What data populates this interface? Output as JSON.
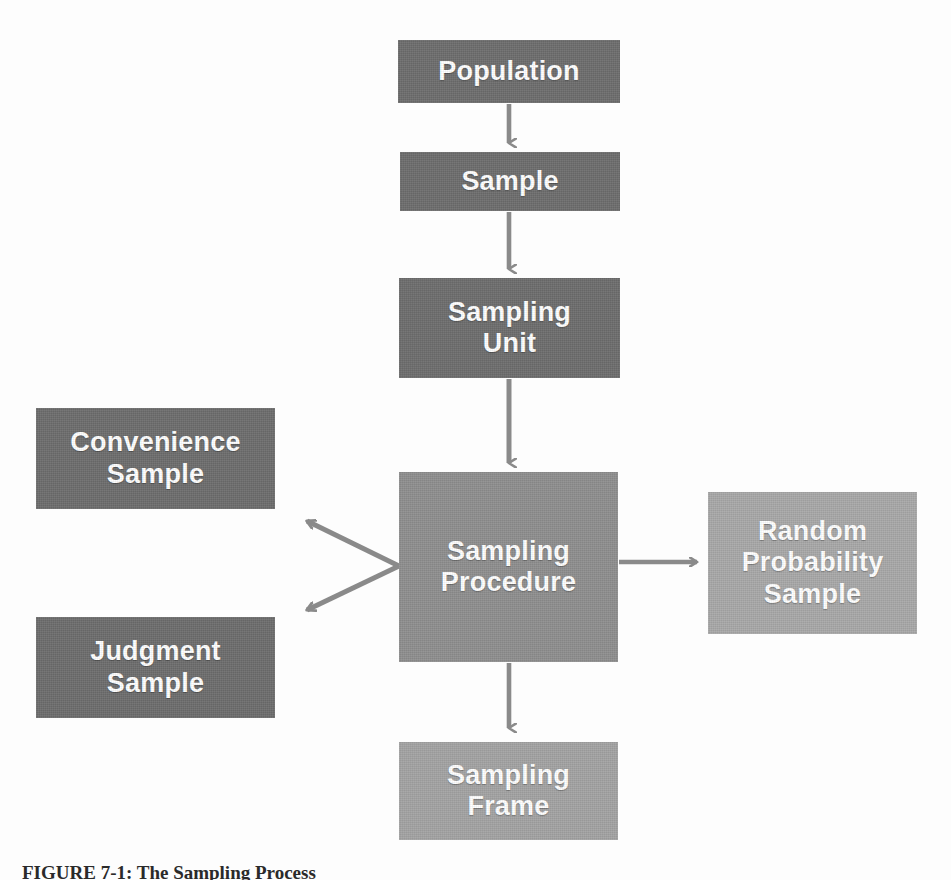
{
  "figure": {
    "caption": "FIGURE 7-1: The Sampling Process",
    "background_color": "#fdfdfd"
  },
  "colors": {
    "box_dark": "#6e6e6e",
    "box_mid": "#8f8f8f",
    "box_light": "#a9a9a9",
    "box_light_alt": "#a4a4a4",
    "arrow": "#8a8a8a",
    "text": "#ffffff",
    "caption_text": "#2a2a2a"
  },
  "nodes": {
    "population": {
      "label": "Population",
      "tone": "dark"
    },
    "sample": {
      "label": "Sample",
      "tone": "dark"
    },
    "sampling_unit": {
      "label": "Sampling\nUnit",
      "tone": "dark"
    },
    "sampling_procedure": {
      "label": "Sampling\nProcedure",
      "tone": "mid"
    },
    "convenience_sample": {
      "label": "Convenience\nSample",
      "tone": "dark"
    },
    "judgment_sample": {
      "label": "Judgment\nSample",
      "tone": "dark"
    },
    "random_probability_sample": {
      "label": "Random\nProbability\nSample",
      "tone": "light"
    },
    "sampling_frame": {
      "label": "Sampling\nFrame",
      "tone": "light_alt"
    }
  },
  "edges": [
    {
      "id": "population-to-sample",
      "from": "population",
      "to": "sample",
      "direction": "down"
    },
    {
      "id": "sample-to-sampling-unit",
      "from": "sample",
      "to": "sampling_unit",
      "direction": "down"
    },
    {
      "id": "sampling-unit-to-sampling-procedure",
      "from": "sampling_unit",
      "to": "sampling_procedure",
      "direction": "down"
    },
    {
      "id": "sampling-procedure-to-convenience-sample",
      "from": "sampling_procedure",
      "to": "convenience_sample",
      "direction": "up-left"
    },
    {
      "id": "sampling-procedure-to-judgment-sample",
      "from": "sampling_procedure",
      "to": "judgment_sample",
      "direction": "down-left"
    },
    {
      "id": "sampling-procedure-to-random-probability-sample",
      "from": "sampling_procedure",
      "to": "random_probability_sample",
      "direction": "right"
    },
    {
      "id": "sampling-procedure-to-sampling-frame",
      "from": "sampling_procedure",
      "to": "sampling_frame",
      "direction": "down"
    }
  ]
}
